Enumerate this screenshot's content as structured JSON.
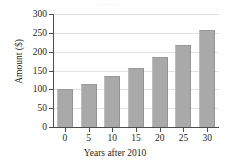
{
  "figure": {
    "top_cutoff_text": "........",
    "bar_color": "#a9a9a9",
    "axis_color": "#4d4d4f",
    "grid_color": "#e3e3e5",
    "background": "#ffffff"
  },
  "chart_data": {
    "type": "bar",
    "title": "",
    "xlabel": "Years after 2010",
    "ylabel": "Amount ($)",
    "categories": [
      "0",
      "5",
      "10",
      "15",
      "20",
      "25",
      "30"
    ],
    "values": [
      100,
      115,
      135,
      158,
      187,
      219,
      257
    ],
    "xtick_labels": [
      "0",
      "5",
      "10",
      "15",
      "20",
      "25",
      "30"
    ],
    "ytick_labels": [
      "0",
      "50",
      "100",
      "150",
      "200",
      "250",
      "300"
    ],
    "ytick_values": [
      0,
      50,
      100,
      150,
      200,
      250,
      300
    ],
    "ylim": [
      0,
      300
    ],
    "grid": "horizontal",
    "legend": "none"
  }
}
